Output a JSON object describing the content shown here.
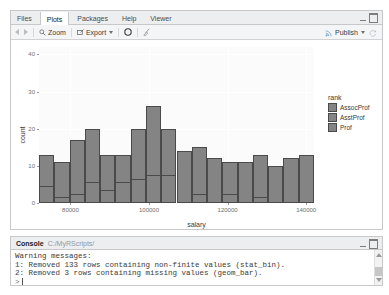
{
  "plots_pane": {
    "tabs": [
      {
        "label": "Files",
        "active": false
      },
      {
        "label": "Plots",
        "active": true
      },
      {
        "label": "Packages",
        "active": false
      },
      {
        "label": "Help",
        "active": false
      },
      {
        "label": "Viewer",
        "active": false
      }
    ],
    "toolbar": {
      "back_icon": "arrow-left-icon",
      "forward_icon": "arrow-right-icon",
      "zoom_label": "Zoom",
      "zoom_icon": "magnifier-icon",
      "export_label": "Export",
      "export_icon": "export-icon",
      "remove_icon": "remove-plot-icon",
      "clear_all_icon": "broom-icon",
      "publish_label": "Publish",
      "publish_icon": "publish-icon",
      "refresh_icon": "refresh-icon"
    },
    "window_controls": {
      "minimize_icon": "minimize-icon",
      "maximize_icon": "maximize-icon"
    }
  },
  "console_pane": {
    "title": "Console",
    "path": "C:/MyRScripts/",
    "window_controls": {
      "minimize_icon": "minimize-icon",
      "maximize_icon": "maximize-icon"
    },
    "lines": [
      "Warning messages:",
      "1: Removed 133 rows containing non-finite values (stat_bin).",
      "2: Removed 3 rows containing missing values (geom_bar)."
    ],
    "prompt": ">"
  },
  "chart_data": {
    "type": "bar",
    "title": "",
    "xlabel": "salary",
    "ylabel": "count",
    "xlim": [
      72000,
      142000
    ],
    "ylim": [
      0,
      42
    ],
    "xticks": [
      80000,
      100000,
      120000,
      140000
    ],
    "xtick_labels": [
      "80000",
      "100000",
      "120000",
      "140000"
    ],
    "yticks": [
      0,
      10,
      20,
      30,
      40
    ],
    "ytick_labels": [
      "0",
      "10",
      "20",
      "30",
      "40"
    ],
    "grid": true,
    "legend": {
      "title": "rank",
      "position": "right",
      "entries": [
        {
          "label": "AssocProf",
          "color": "#848484"
        },
        {
          "label": "AsstProf",
          "color": "#848484"
        },
        {
          "label": "Prof",
          "color": "#848484"
        }
      ]
    },
    "bin_centers": [
      74500,
      76800,
      79100,
      81400,
      83700,
      86000,
      88300,
      90600,
      92900,
      95200,
      97500,
      99800,
      102100,
      104400,
      106700,
      109000,
      111300,
      113600,
      115900,
      118200,
      120500,
      122800,
      125100,
      127400,
      129700,
      132000,
      134300,
      136600
    ],
    "bars": [
      {
        "total": 13,
        "segments": [
          4,
          9
        ]
      },
      {
        "total": 11,
        "segments": [
          1,
          10
        ]
      },
      {
        "total": 17,
        "segments": [
          2,
          15
        ]
      },
      {
        "total": 20,
        "segments": [
          5,
          15
        ]
      },
      {
        "total": 13,
        "segments": [
          3,
          10
        ]
      },
      {
        "total": 13,
        "segments": [
          5,
          8
        ]
      },
      {
        "total": 20,
        "segments": [
          6,
          14
        ]
      },
      {
        "total": 26,
        "segments": [
          7,
          19
        ]
      },
      {
        "total": 20,
        "segments": [
          7,
          13
        ]
      },
      {
        "total": 14,
        "segments": [
          14
        ]
      },
      {
        "total": 15,
        "segments": [
          2,
          13
        ]
      },
      {
        "total": 12,
        "segments": [
          12
        ]
      },
      {
        "total": 11,
        "segments": [
          2,
          9
        ]
      },
      {
        "total": 11,
        "segments": [
          11
        ]
      },
      {
        "total": 13,
        "segments": [
          1,
          12
        ]
      },
      {
        "total": 10,
        "segments": [
          10
        ]
      },
      {
        "total": 12,
        "segments": [
          12
        ]
      },
      {
        "total": 13,
        "segments": [
          13
        ]
      }
    ]
  }
}
